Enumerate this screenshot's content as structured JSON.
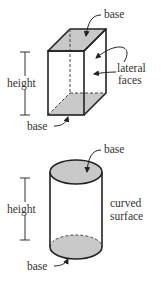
{
  "colors": {
    "line": "#222222",
    "fill": "#c8c8c8",
    "text": "#333333",
    "background": "#ffffff"
  },
  "prism": {
    "top_base_label": "base",
    "lateral_label_line1": "lateral",
    "lateral_label_line2": "faces",
    "height_label": "height",
    "bottom_base_label": "base"
  },
  "cylinder": {
    "top_base_label": "base",
    "curved_label_line1": "curved",
    "curved_label_line2": "surface",
    "height_label": "height",
    "bottom_base_label": "base"
  }
}
